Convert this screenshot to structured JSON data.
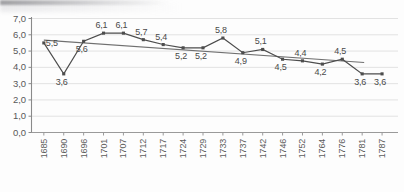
{
  "chart_data": {
    "type": "line",
    "title": "",
    "subtitle": "",
    "xlabel": "",
    "ylabel": "",
    "ylim": [
      0,
      7
    ],
    "ytick_step": 1,
    "grid": true,
    "legend": "none",
    "decimal_separator": ",",
    "categories": [
      "1685",
      "1690",
      "1696",
      "1701",
      "1707",
      "1712",
      "1717",
      "1724",
      "1729",
      "1733",
      "1737",
      "1742",
      "1746",
      "1752",
      "1764",
      "1776",
      "1781",
      "1787"
    ],
    "ytick_labels": [
      "0,0",
      "1,0",
      "2,0",
      "3,0",
      "4,0",
      "5,0",
      "6,0",
      "7,0"
    ],
    "ytick_values": [
      0,
      1,
      2,
      3,
      4,
      5,
      6,
      7
    ],
    "series": [
      {
        "name": "data",
        "marker": "square",
        "color": "#4d4d4d",
        "values": [
          5.5,
          3.6,
          5.6,
          6.1,
          6.1,
          5.7,
          5.4,
          5.2,
          5.2,
          5.8,
          4.9,
          5.1,
          4.5,
          4.4,
          4.2,
          4.5,
          3.6,
          3.6
        ],
        "labels": [
          "5,5",
          "3,6",
          "5,6",
          "6,1",
          "6,1",
          "5,7",
          "5,4",
          "5,2",
          "5,2",
          "5,8",
          "4,9",
          "5,1",
          "4,5",
          "4,4",
          "4,2",
          "4,5",
          "3,6",
          "3,6"
        ],
        "label_positions": [
          "right",
          "below",
          "below",
          "above",
          "above",
          "above",
          "above",
          "below",
          "below",
          "above",
          "below",
          "above",
          "below",
          "above",
          "below",
          "above",
          "below",
          "below"
        ]
      },
      {
        "name": "trend",
        "marker": "none",
        "color": "#707070",
        "x_start": 0,
        "x_end": 16.1,
        "y_start": 5.67,
        "y_end": 4.3
      }
    ]
  }
}
